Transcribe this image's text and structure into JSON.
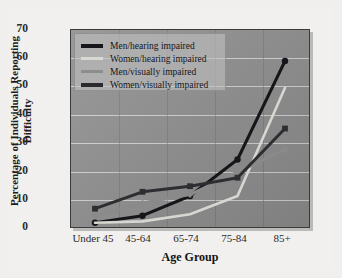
{
  "chart_data": {
    "type": "line",
    "title": "",
    "xlabel": "Age Group",
    "ylabel": "Percentage of Individuals Reporting Difficulty",
    "categories": [
      "Under 45",
      "45-64",
      "65-74",
      "75-84",
      "85+"
    ],
    "ylim": [
      0,
      70
    ],
    "yticks": [
      0,
      10,
      20,
      30,
      40,
      50,
      60,
      70
    ],
    "grid": true,
    "legend_position": "top-left",
    "series": [
      {
        "name": "Men/hearing impaired",
        "color": "#16161a",
        "marker": "circle",
        "values": [
          1.5,
          4,
          11,
          24,
          59
        ]
      },
      {
        "name": "Women/hearing impaired",
        "color": "#d7d7d2",
        "marker": "none",
        "values": [
          1.5,
          2,
          4.5,
          11,
          49.5
        ]
      },
      {
        "name": "Men/visually impaired",
        "color": "#8a8a8a",
        "marker": "diamond",
        "values": [
          4,
          8.5,
          11.5,
          19.5,
          27.5
        ]
      },
      {
        "name": "Women/visually impaired",
        "color": "#2e2e32",
        "marker": "square",
        "values": [
          6.5,
          12.5,
          14.5,
          17.5,
          35
        ]
      }
    ]
  },
  "axis": {
    "y_tick_labels": [
      "70",
      "60",
      "50",
      "40",
      "30",
      "20",
      "10",
      "0"
    ],
    "x_tick_labels": [
      "Under 45",
      "45-64",
      "65-74",
      "75-84",
      "85+"
    ],
    "x_axis_title": "Age Group",
    "y_axis_title_line1": "Percentage of Individuals Reporting",
    "y_axis_title_line2": "Difficulty"
  },
  "legend": {
    "items": [
      {
        "label": "Men/hearing impaired",
        "color": "#16161a"
      },
      {
        "label": "Women/hearing impaired",
        "color": "#d9d9d4"
      },
      {
        "label": "Men/visually impaired",
        "color": "#8d8d8d"
      },
      {
        "label": "Women/visually impaired",
        "color": "#2b2b2f"
      }
    ]
  },
  "colors": {
    "page_background": "#f0efed",
    "plot_background": "#8e8e8e",
    "gridline": "#dcdcdc",
    "frame": "#3b3b3b"
  }
}
